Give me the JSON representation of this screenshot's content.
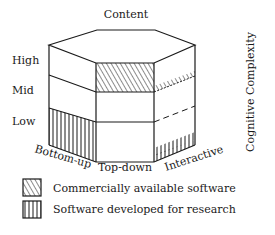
{
  "diagram": {
    "top_label": "Content",
    "axis_label": "Cognitive Complexity",
    "levels": [
      "High",
      "Mid",
      "Low"
    ],
    "faces": [
      "Bottom-up",
      "Top-down",
      "Interactive"
    ],
    "colors": {
      "stroke": "#1a1a1a",
      "background": "#ffffff"
    }
  },
  "legend": [
    {
      "pattern": "diagonal-hatch",
      "label": "Commercially available software"
    },
    {
      "pattern": "vertical-hatch",
      "label": "Software developed for research"
    }
  ]
}
